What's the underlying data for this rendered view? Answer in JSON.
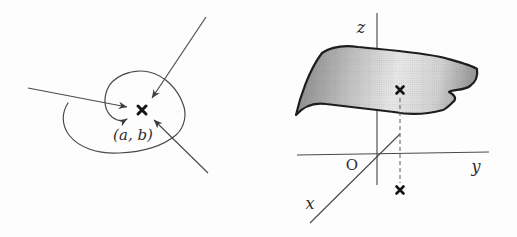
{
  "left_figure": {
    "point_label": "(a, b)"
  },
  "right_figure": {
    "origin_label": "O",
    "x_axis_label": "x",
    "y_axis_label": "y",
    "z_axis_label": "z"
  },
  "colors": {
    "background": "#fdfdfd",
    "line": "#4a4a4a",
    "arrowhead": "#3d3d3d",
    "cross_marker": "#141414",
    "surface_outline": "#1d1d1d",
    "surface_shade_dark": "#8a8a8a",
    "surface_shade_mid": "#c2c2c2",
    "surface_shade_light": "#e9e9e9",
    "label_text": "#2e2e2e"
  }
}
